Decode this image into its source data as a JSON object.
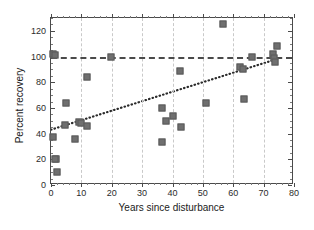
{
  "chart_data": {
    "type": "scatter",
    "title": "",
    "xlabel": "Years since disturbance",
    "ylabel": "Percent recovery",
    "xlim": [
      0,
      80
    ],
    "ylim": [
      0,
      130
    ],
    "xticks": [
      0,
      10,
      20,
      30,
      40,
      50,
      60,
      70,
      80
    ],
    "yticks": [
      0,
      20,
      40,
      60,
      80,
      100,
      120
    ],
    "xtick_labels": [
      "0",
      "10",
      "20",
      "30",
      "40",
      "50",
      "60",
      "70",
      "80"
    ],
    "ytick_labels": [
      "0",
      "20",
      "40",
      "60",
      "80",
      "100",
      "120"
    ],
    "grid": "vertical-dashed-at-xticks",
    "legend": "none",
    "marker": "filled-gray-square",
    "marker_color": "#6f6f6f",
    "points": [
      {
        "x": 0.5,
        "y": 102
      },
      {
        "x": 1.2,
        "y": 101
      },
      {
        "x": 0.5,
        "y": 37
      },
      {
        "x": 1.5,
        "y": 20.5
      },
      {
        "x": 1.3,
        "y": 20
      },
      {
        "x": 2.0,
        "y": 10
      },
      {
        "x": 4.5,
        "y": 47
      },
      {
        "x": 5.0,
        "y": 64
      },
      {
        "x": 8.0,
        "y": 35.5
      },
      {
        "x": 9.3,
        "y": 49
      },
      {
        "x": 9.8,
        "y": 48.5
      },
      {
        "x": 12.0,
        "y": 46
      },
      {
        "x": 12.0,
        "y": 84
      },
      {
        "x": 19.8,
        "y": 99.5
      },
      {
        "x": 36.5,
        "y": 60
      },
      {
        "x": 36.5,
        "y": 33.5
      },
      {
        "x": 38.0,
        "y": 50
      },
      {
        "x": 40.3,
        "y": 54
      },
      {
        "x": 42.5,
        "y": 88.5
      },
      {
        "x": 42.8,
        "y": 45
      },
      {
        "x": 51.0,
        "y": 64
      },
      {
        "x": 56.5,
        "y": 125
      },
      {
        "x": 62.2,
        "y": 91.5
      },
      {
        "x": 63.2,
        "y": 90.5
      },
      {
        "x": 63.5,
        "y": 67
      },
      {
        "x": 66.3,
        "y": 99.5
      },
      {
        "x": 73.2,
        "y": 102
      },
      {
        "x": 73.4,
        "y": 99
      },
      {
        "x": 73.6,
        "y": 96
      },
      {
        "x": 74.5,
        "y": 108
      }
    ],
    "reference_line": {
      "orientation": "horizontal",
      "y": 100,
      "style": "dashed",
      "color": "#4a4a4a",
      "label": ""
    },
    "trend_line": {
      "style": "dotted",
      "color": "#2b2b2b",
      "x_start": 0,
      "y_start": 42,
      "x_end": 75.5,
      "y_end": 98
    }
  }
}
